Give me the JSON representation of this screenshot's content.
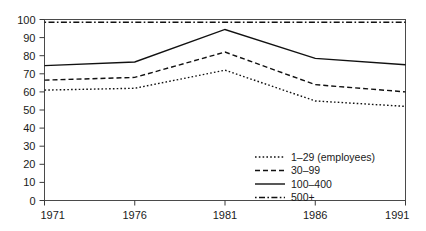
{
  "chart_data": {
    "type": "line",
    "title": "",
    "subtitle": "",
    "xlabel": "",
    "ylabel": "",
    "x": [
      1971,
      1976,
      1981,
      1986,
      1991
    ],
    "categories": [
      "1971",
      "1976",
      "1981",
      "1986",
      "1991"
    ],
    "xlim": [
      1971,
      1991
    ],
    "ylim": [
      0,
      100
    ],
    "xticks": [
      "1971",
      "1976",
      "1981",
      "1986",
      "1991"
    ],
    "yticks": [
      "0",
      "10",
      "20",
      "30",
      "40",
      "50",
      "60",
      "70",
      "80",
      "90",
      "100"
    ],
    "grid": false,
    "legend_position": "bottom-right",
    "series": [
      {
        "name": "1–29 (employees)",
        "linestyle": "dotted",
        "color": "#111111",
        "values": [
          61,
          62,
          72,
          55,
          52
        ]
      },
      {
        "name": "30–99",
        "linestyle": "dashed",
        "color": "#111111",
        "values": [
          66.5,
          68,
          82,
          64,
          60
        ]
      },
      {
        "name": "100–400",
        "linestyle": "solid",
        "color": "#111111",
        "values": [
          74.5,
          76.5,
          94.5,
          78.5,
          75
        ]
      },
      {
        "name": "500+",
        "linestyle": "dashdot",
        "color": "#111111",
        "values": [
          98.5,
          98.5,
          98.5,
          98.5,
          98.5
        ]
      }
    ]
  },
  "legend": {
    "items": [
      {
        "label": "1–29 (employees)",
        "dash": "1.6 2.2"
      },
      {
        "label": "30–99",
        "dash": "5 3"
      },
      {
        "label": "100–400",
        "dash": "none"
      },
      {
        "label": "500+",
        "dash": "1.6 2.4 6 2.4"
      }
    ]
  }
}
